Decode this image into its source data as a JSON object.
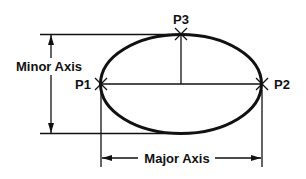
{
  "diagram": {
    "labels": {
      "p1": "P1",
      "p2": "P2",
      "p3": "P3",
      "minor_axis": "Minor Axis",
      "major_axis": "Major Axis"
    },
    "colors": {
      "stroke": "#111111",
      "background": "#ffffff"
    }
  }
}
